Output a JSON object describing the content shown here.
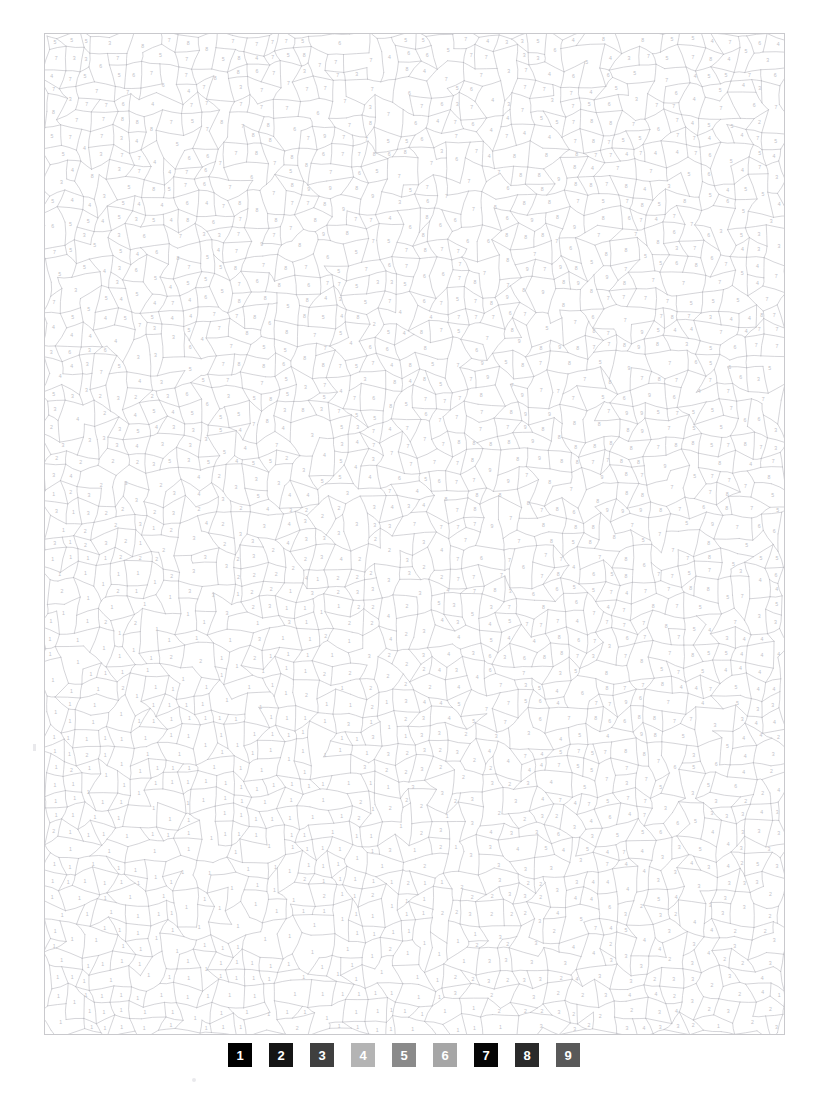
{
  "page": {
    "type": "color-by-number-puzzle",
    "background_color": "#ffffff",
    "width": 833,
    "height": 1119
  },
  "puzzle": {
    "border_color": "#c9c9cd",
    "line_color": "#b9b9c0",
    "number_color": "#c2c2c8",
    "frame": {
      "x": 44,
      "y": 33,
      "width": 741,
      "height": 1002
    },
    "palette_values": [
      "1",
      "2",
      "3",
      "4",
      "5",
      "6",
      "7",
      "8",
      "9"
    ],
    "description": "Dense field of thousands of small irregular outlined regions, each labelled with a tiny grey digit from 1 to 9."
  },
  "legend": {
    "swatches": [
      {
        "number": "1",
        "color": "#000000"
      },
      {
        "number": "2",
        "color": "#151515"
      },
      {
        "number": "3",
        "color": "#3f3f3f"
      },
      {
        "number": "4",
        "color": "#b4b4b4"
      },
      {
        "number": "5",
        "color": "#8a8a8a"
      },
      {
        "number": "6",
        "color": "#a6a6a6"
      },
      {
        "number": "7",
        "color": "#060606"
      },
      {
        "number": "8",
        "color": "#2a2a2a"
      },
      {
        "number": "9",
        "color": "#595959"
      }
    ]
  }
}
